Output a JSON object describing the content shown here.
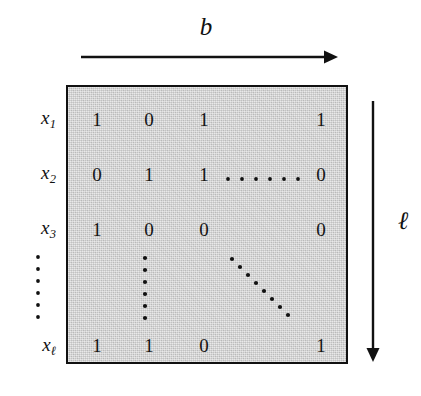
{
  "figure": {
    "background_color": "#ffffff",
    "ink_color": "#111111",
    "matrix_fill_color": "#d2d2d2"
  },
  "top_axis": {
    "label": "b",
    "arrow_direction": "right",
    "arrow_name": "width-arrow"
  },
  "right_axis": {
    "label": "ℓ",
    "arrow_direction": "down",
    "arrow_name": "length-arrow"
  },
  "row_labels": [
    {
      "base": "x",
      "sub": "1"
    },
    {
      "base": "x",
      "sub": "2"
    },
    {
      "base": "x",
      "sub": "3"
    },
    {
      "base": "x",
      "sub": "ℓ"
    }
  ],
  "row_label_ellipsis": "⋮",
  "matrix": {
    "rows": [
      {
        "name": "row-x1",
        "cells": [
          "1",
          "0",
          "1",
          "",
          "1"
        ]
      },
      {
        "name": "row-x2",
        "cells": [
          "0",
          "1",
          "1",
          "⋯",
          "0"
        ]
      },
      {
        "name": "row-x3",
        "cells": [
          "1",
          "0",
          "0",
          "",
          "0"
        ]
      },
      {
        "name": "row-xl",
        "cells": [
          "1",
          "1",
          "0",
          "",
          "1"
        ]
      }
    ],
    "inner_vertical_ellipsis": "⋮",
    "inner_diagonal_ellipsis": "⋱",
    "horizontal_ellipsis": "⋯"
  }
}
